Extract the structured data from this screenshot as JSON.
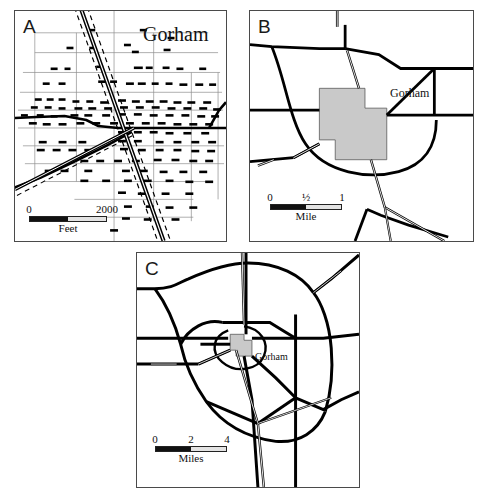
{
  "figure": {
    "place_name": "Gorham",
    "panels": [
      {
        "id": "A",
        "letter": "A",
        "title": "Gorham",
        "scale": {
          "ticks": [
            "0",
            "2000"
          ],
          "unit": "Feet",
          "segments": 2
        }
      },
      {
        "id": "B",
        "letter": "B",
        "label": "Gorham",
        "scale": {
          "ticks": [
            "0",
            "½",
            "1"
          ],
          "unit": "Mile",
          "segments": 2
        }
      },
      {
        "id": "C",
        "letter": "C",
        "label": "Gorham",
        "scale": {
          "ticks": [
            "0",
            "2",
            "4"
          ],
          "unit": "Miles",
          "segments": 2
        }
      }
    ],
    "colors": {
      "urban_fill": "#c9c9c9",
      "urban_stroke": "#5a5a5a",
      "road": "#000000",
      "street_grid": "#8c8c8c",
      "panel_border": "#4a4a4a",
      "scale_dark": "#111111",
      "scale_light": "#e3e3e3"
    }
  }
}
